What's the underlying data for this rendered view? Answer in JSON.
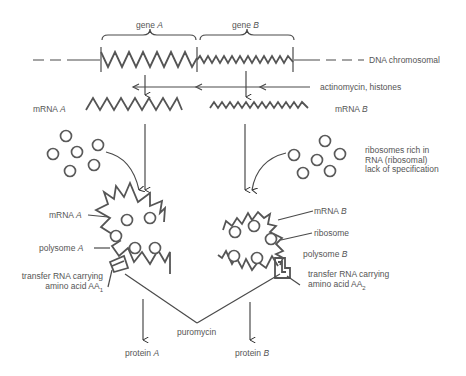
{
  "diagram": {
    "genes": {
      "gene_a": {
        "word": "gene",
        "letter": "A"
      },
      "gene_b": {
        "word": "gene",
        "letter": "B"
      }
    },
    "labels": {
      "dna": "DNA chromosomal",
      "inhibitor_transcription": "actinomycin, histones",
      "mrna_a": {
        "word": "mRNA",
        "letter": "A"
      },
      "mrna_b": {
        "word": "mRNA",
        "letter": "B"
      },
      "ribosomes_line1": "ribosomes rich in",
      "ribosomes_line2": "RNA (ribosomal)",
      "ribosomes_line3": "lack of specification",
      "polysome_mrna_a": {
        "word": "mRNA",
        "letter": "A"
      },
      "polysome_a": {
        "word": "polysome",
        "letter": "A"
      },
      "trna_a_line1": "transfer RNA carrying",
      "trna_a_line2": "amino acid AA",
      "trna_a_sub": "1",
      "polysome_mrna_b": {
        "word": "mRNA",
        "letter": "B"
      },
      "ribosome": "ribosome",
      "polysome_b": {
        "word": "polysome",
        "letter": "B"
      },
      "trna_b_line1": "transfer RNA carrying",
      "trna_b_line2": "amino acid AA",
      "trna_b_sub": "2",
      "inhibitor_translation": "puromycin",
      "protein_a": {
        "word": "protein",
        "letter": "A"
      },
      "protein_b": {
        "word": "protein",
        "letter": "B"
      }
    },
    "colors": {
      "stroke": "#4a4a4a",
      "text": "#555555",
      "background": "#ffffff"
    }
  }
}
